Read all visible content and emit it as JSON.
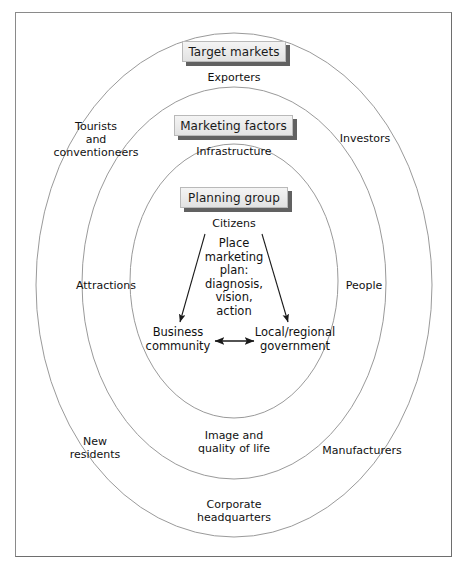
{
  "diagram": {
    "title_boxes": [
      {
        "label": "Target markets",
        "name": "target-markets-box"
      },
      {
        "label": "Marketing factors",
        "name": "marketing-factors-box"
      },
      {
        "label": "Planning group",
        "name": "planning-group-box"
      }
    ],
    "ring_sublabels": [
      {
        "label": "Exporters"
      },
      {
        "label": "Infrastructure"
      },
      {
        "label": "Citizens"
      }
    ],
    "outer_ring_labels": [
      {
        "label": "Tourists\nand\nconventioneers"
      },
      {
        "label": "Investors"
      },
      {
        "label": "New\nresidents"
      },
      {
        "label": "Manufacturers"
      },
      {
        "label": "Corporate\nheadquarters"
      }
    ],
    "middle_ring_labels": [
      {
        "label": "Attractions"
      },
      {
        "label": "People"
      },
      {
        "label": "Image and\nquality of life"
      }
    ],
    "center": {
      "plan_text": "Place\nmarketing\nplan:\ndiagnosis,\nvision,\naction",
      "left_node": "Business\ncommunity",
      "right_node": "Local/regional\ngovernment"
    },
    "colors": {
      "frame_border": "#8a8a8a",
      "ellipse_stroke": "#9a9a9a",
      "arrow_stroke": "#1a1a1a",
      "box_shadow": "#616161",
      "text": "#111111"
    }
  }
}
